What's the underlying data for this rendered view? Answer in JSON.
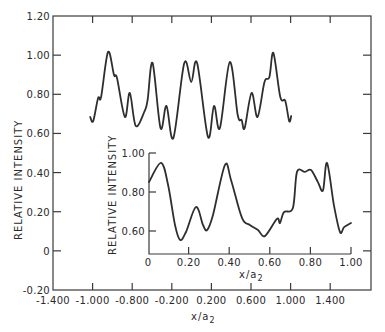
{
  "chart_data": [
    {
      "id": "main",
      "type": "line",
      "title": "",
      "xlabel": "x/a2",
      "ylabel": "RELATIVE INTENSITY",
      "xlim": [
        -1.4,
        1.8
      ],
      "ylim": [
        -0.2,
        1.2
      ],
      "grid": false,
      "legend": null,
      "x_tick_labels": [
        "-1.400",
        "-1.000",
        "-0.800",
        "-0.200",
        "0.200",
        "0.600",
        "1.000",
        "1.400"
      ],
      "x_ticks": [
        -1.4,
        -1.0,
        -0.6,
        -0.2,
        0.2,
        0.6,
        1.0,
        1.4
      ],
      "y_tick_labels": [
        "1.20",
        "1.00",
        "0.80",
        "0.60",
        "0.40",
        "0.20",
        "0",
        "-0.20"
      ],
      "y_ticks": [
        1.2,
        1.0,
        0.8,
        0.6,
        0.4,
        0.2,
        0,
        -0.2
      ],
      "series": [
        {
          "name": "intensity",
          "x": [
            -1.024,
            -0.994,
            -0.944,
            -0.914,
            -0.844,
            -0.784,
            -0.754,
            -0.674,
            -0.624,
            -0.564,
            -0.474,
            -0.444,
            -0.394,
            -0.314,
            -0.254,
            -0.184,
            -0.074,
            -0.004,
            0.056,
            0.166,
            0.226,
            0.286,
            0.386,
            0.466,
            0.506,
            0.536,
            0.606,
            0.666,
            0.736,
            0.786,
            0.826,
            0.896,
            0.946,
            0.986,
            1.006
          ],
          "y": [
            0.684,
            0.663,
            0.781,
            0.786,
            1.016,
            0.899,
            0.883,
            0.684,
            0.807,
            0.638,
            0.715,
            0.771,
            0.96,
            0.628,
            0.74,
            0.577,
            0.96,
            0.863,
            0.96,
            0.582,
            0.74,
            0.628,
            0.965,
            0.694,
            0.668,
            0.628,
            0.807,
            0.684,
            0.863,
            0.888,
            1.011,
            0.786,
            0.766,
            0.663,
            0.689
          ]
        }
      ]
    },
    {
      "id": "inset",
      "type": "line",
      "title": "",
      "xlabel": "x/a2",
      "ylabel": "RELATIVE INTENSITY",
      "xlim": [
        0,
        1.0
      ],
      "ylim": [
        0.48,
        1.0
      ],
      "grid": false,
      "legend": null,
      "x_tick_labels": [
        "0",
        "0.20",
        "0.40",
        "0.60",
        "0.80",
        "1.00"
      ],
      "x_ticks": [
        0,
        0.2,
        0.4,
        0.6,
        0.8,
        1.0
      ],
      "y_tick_labels": [
        "1.00",
        "0.80",
        "0.60"
      ],
      "y_ticks": [
        1.0,
        0.8,
        0.6
      ],
      "series": [
        {
          "name": "intensity",
          "x": [
            0.005,
            0.064,
            0.099,
            0.133,
            0.158,
            0.187,
            0.236,
            0.271,
            0.291,
            0.32,
            0.379,
            0.409,
            0.463,
            0.502,
            0.542,
            0.576,
            0.635,
            0.65,
            0.67,
            0.714,
            0.734,
            0.773,
            0.803,
            0.837,
            0.862,
            0.882,
            0.916,
            0.946,
            0.966,
            1.0
          ],
          "y": [
            0.851,
            0.949,
            0.836,
            0.631,
            0.554,
            0.595,
            0.723,
            0.631,
            0.605,
            0.682,
            0.938,
            0.862,
            0.667,
            0.631,
            0.605,
            0.574,
            0.662,
            0.641,
            0.697,
            0.718,
            0.903,
            0.903,
            0.913,
            0.851,
            0.808,
            0.949,
            0.733,
            0.595,
            0.62,
            0.641
          ]
        }
      ]
    }
  ],
  "main": {
    "ylabel": "RELATIVE INTENSITY",
    "xlabel_base": "x/a",
    "xlabel_sub": "2"
  },
  "inset": {
    "ylabel": "RELATIVE INTENSITY",
    "xlabel_base": "x/a",
    "xlabel_sub": "2"
  }
}
